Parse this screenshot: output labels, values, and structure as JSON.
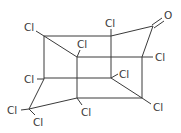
{
  "diagram": {
    "type": "chemical-structure",
    "atoms": [
      {
        "id": "A",
        "x": 44,
        "y": 36
      },
      {
        "id": "B",
        "x": 77,
        "y": 57
      },
      {
        "id": "C",
        "x": 111,
        "y": 36
      },
      {
        "id": "D",
        "x": 153,
        "y": 26
      },
      {
        "id": "E",
        "x": 142,
        "y": 57
      },
      {
        "id": "F",
        "x": 44,
        "y": 79
      },
      {
        "id": "G",
        "x": 77,
        "y": 79
      },
      {
        "id": "H",
        "x": 111,
        "y": 78
      },
      {
        "id": "I",
        "x": 77,
        "y": 98
      },
      {
        "id": "J",
        "x": 142,
        "y": 98
      },
      {
        "id": "K",
        "x": 29,
        "y": 109
      }
    ],
    "labels": [
      {
        "text": "Cl",
        "x": 24,
        "y": 31
      },
      {
        "text": "Cl",
        "x": 77,
        "y": 48
      },
      {
        "text": "Cl",
        "x": 105,
        "y": 27
      },
      {
        "text": "O",
        "x": 164,
        "y": 19
      },
      {
        "text": "Cl",
        "x": 155,
        "y": 61
      },
      {
        "text": "Cl",
        "x": 24,
        "y": 83
      },
      {
        "text": "Cl",
        "x": 119,
        "y": 78
      },
      {
        "text": "Cl",
        "x": 81,
        "y": 116
      },
      {
        "text": "Cl",
        "x": 153,
        "y": 111
      },
      {
        "text": "Cl",
        "x": 7,
        "y": 114
      },
      {
        "text": "Cl",
        "x": 33,
        "y": 126
      }
    ]
  }
}
